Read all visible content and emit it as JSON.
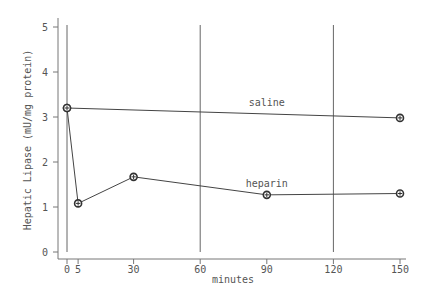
{
  "chart_data": {
    "type": "line",
    "title": "",
    "xlabel": "minutes",
    "ylabel": "Hepatic Lipase (mU/mg protein)",
    "xlim": [
      0,
      150
    ],
    "ylim": [
      0,
      5
    ],
    "x_ticks": [
      0,
      5,
      30,
      60,
      90,
      120,
      150
    ],
    "y_ticks": [
      0,
      1,
      2,
      3,
      4,
      5
    ],
    "vertical_reference_lines": [
      0,
      60,
      120
    ],
    "grid": false,
    "legend": "inline labels on lines",
    "series": [
      {
        "name": "saline",
        "label_position": {
          "x": 90,
          "y": 3.25
        },
        "x": [
          0,
          150
        ],
        "values": [
          3.2,
          2.98
        ]
      },
      {
        "name": "heparin",
        "label_position": {
          "x": 90,
          "y": 1.45
        },
        "x": [
          0,
          5,
          30,
          90,
          150
        ],
        "values": [
          3.2,
          1.08,
          1.67,
          1.27,
          1.3
        ]
      }
    ]
  }
}
